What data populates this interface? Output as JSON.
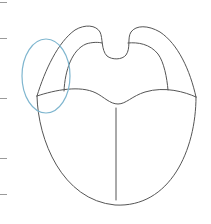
{
  "diagram": {
    "title": "Tongue outline with highlighted lateral region",
    "highlight": {
      "shape": "ellipse",
      "region": "left lateral edge of tongue",
      "color": "#7fb6cf"
    },
    "stroke_color": "#555555",
    "left_ticks_y": [
      2,
      38,
      98,
      158,
      194
    ]
  }
}
